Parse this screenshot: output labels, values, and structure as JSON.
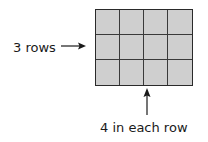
{
  "diagram": {
    "grid": {
      "rows": 3,
      "columns": 4,
      "fill_color": "#cfcfcf",
      "line_color": "#2a2a2a"
    },
    "labels": {
      "rows_label": "3 rows",
      "columns_label": "4 in each row"
    },
    "arrows": [
      {
        "from": "rows_label",
        "direction": "right",
        "points_to": "grid-rows"
      },
      {
        "from": "columns_label",
        "direction": "up",
        "points_to": "grid-columns"
      }
    ]
  }
}
